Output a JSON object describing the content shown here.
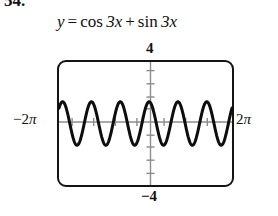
{
  "problem": {
    "number": "54."
  },
  "equation": {
    "lhs": "y",
    "equals": "=",
    "term1_fn": "cos",
    "term1_arg": "3x",
    "plus": "+",
    "term2_fn": "sin",
    "term2_arg": "3x",
    "full_text": "y = cos 3x + sin 3x"
  },
  "window": {
    "ymax_label": "4",
    "ymin_label": "-4",
    "xmin_label": "-2π",
    "xmax_label": "2π",
    "xmin_sign": "−",
    "xmin_num": "2",
    "xmin_pi": "π",
    "xmax_num": "2",
    "xmax_pi": "π",
    "ymin_sign": "−",
    "ymin_num": "4"
  },
  "colors": {
    "curve": "#0d0d0d",
    "frame": "#141414",
    "axis": "#8c8c8c",
    "background": "#ffffff",
    "text": "#111111"
  },
  "chart_data": {
    "type": "line",
    "xlabel": "x",
    "ylabel": "y",
    "xlim": [
      -6.283185307,
      6.283185307
    ],
    "ylim": [
      -4,
      4
    ],
    "xtick_labels": [
      "-2π",
      "2π"
    ],
    "ytick_labels": [
      "4",
      "-4"
    ],
    "xtick_spacing": 1.570796327,
    "ytick_spacing": 1,
    "grid": false,
    "legend": null,
    "amplitude": 1.414213562,
    "period": 2.094395102,
    "cycles_shown": 6,
    "phase_shift": 0.785398163,
    "function_form": "sqrt(2)*sin(3x + pi/4)",
    "series": [
      {
        "name": "y = cos 3x + sin 3x",
        "x": [
          -6.2832,
          -6.0832,
          -5.8832,
          -5.6832,
          -5.4832,
          -5.2832,
          -5.0832,
          -4.8832,
          -4.6832,
          -4.4832,
          -4.2832,
          -4.0832,
          -3.8832,
          -3.6832,
          -3.4832,
          -3.2832,
          -3.0832,
          -2.8832,
          -2.6832,
          -2.4832,
          -2.2832,
          -2.0832,
          -1.8832,
          -1.6832,
          -1.4832,
          -1.2832,
          -1.0832,
          -0.8832,
          -0.6832,
          -0.4832,
          -0.2832,
          -0.0832,
          0.1168,
          0.3168,
          0.5168,
          0.7168,
          0.9168,
          1.1168,
          1.3168,
          1.5168,
          1.7168,
          1.9168,
          2.1168,
          2.3168,
          2.5168,
          2.7168,
          2.9168,
          3.1168,
          3.3168,
          3.5168,
          3.7168,
          3.9168,
          4.1168,
          4.3168,
          4.5168,
          4.7168,
          4.9168,
          5.1168,
          5.3168,
          5.5168,
          5.7168,
          5.9168,
          6.1168,
          6.2832
        ],
        "y": [
          1.0,
          1.406,
          1.046,
          0.053,
          -0.995,
          -1.414,
          -1.09,
          -0.157,
          0.929,
          1.414,
          1.131,
          0.261,
          -0.857,
          -1.405,
          -1.166,
          -0.362,
          0.779,
          1.39,
          1.195,
          0.46,
          -0.696,
          -1.368,
          -1.219,
          -0.555,
          0.608,
          1.339,
          1.237,
          0.646,
          -0.516,
          -1.304,
          -1.25,
          -0.732,
          0.421,
          1.261,
          1.258,
          0.811,
          -0.323,
          -1.212,
          -1.26,
          -0.884,
          0.222,
          1.157,
          1.257,
          0.95,
          -0.119,
          -1.096,
          -1.248,
          -1.009,
          0.015,
          1.029,
          1.233,
          1.06,
          0.09,
          -0.957,
          -1.212,
          -1.104,
          -0.195,
          0.88,
          1.185,
          1.14,
          0.298,
          -0.798,
          -1.152,
          1.0
        ]
      }
    ]
  }
}
